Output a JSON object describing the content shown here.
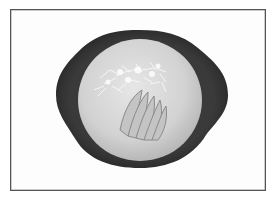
{
  "image": {
    "description": "Grayscale photo of a bowl of creamy soup topped with shredded cheese and sliced fan garnish, viewed from above, inside a thin rectangular frame",
    "colors": {
      "frame_border": "#555555",
      "background": "#fdfdfd",
      "bowl_rim": "#2e2e2e",
      "soup": "#d4d4d4",
      "cheese": "#f2f2f2",
      "slices": "#bdbdbd"
    }
  }
}
